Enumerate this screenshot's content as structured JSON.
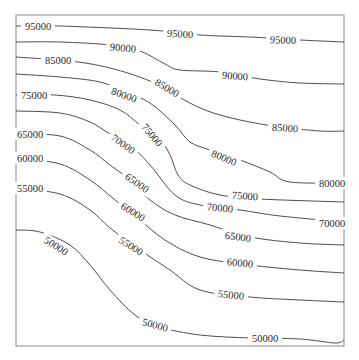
{
  "chart_data": {
    "type": "contour",
    "title": "",
    "xlabel": "",
    "ylabel": "",
    "grid": false,
    "legend": null,
    "levels": [
      50000,
      55000,
      60000,
      65000,
      70000,
      75000,
      80000,
      85000,
      90000,
      95000
    ],
    "frame": {
      "x0": 16,
      "y0": 15,
      "x1": 344,
      "y1": 346
    },
    "contours": [
      {
        "level": 95000,
        "points": [
          [
            16,
            26
          ],
          [
            60,
            26
          ],
          [
            150,
            30
          ],
          [
            200,
            35
          ],
          [
            250,
            37
          ],
          [
            300,
            40
          ],
          [
            344,
            42
          ]
        ],
        "labels": [
          {
            "text": "95000",
            "x": 38,
            "y": 26,
            "angle": 0
          },
          {
            "text": "95000",
            "x": 180,
            "y": 34,
            "angle": 3
          },
          {
            "text": "95000",
            "x": 283,
            "y": 40,
            "angle": 2
          }
        ]
      },
      {
        "level": 90000,
        "points": [
          [
            16,
            42
          ],
          [
            60,
            42
          ],
          [
            110,
            45
          ],
          [
            140,
            51
          ],
          [
            165,
            64
          ],
          [
            180,
            70
          ],
          [
            220,
            72
          ],
          [
            260,
            79
          ],
          [
            300,
            83
          ],
          [
            344,
            84
          ]
        ],
        "labels": [
          {
            "text": "90000",
            "x": 123,
            "y": 48,
            "angle": 5
          },
          {
            "text": "90000",
            "x": 235,
            "y": 76,
            "angle": 4
          }
        ]
      },
      {
        "level": 85000,
        "points": [
          [
            16,
            57
          ],
          [
            70,
            61
          ],
          [
            110,
            68
          ],
          [
            150,
            81
          ],
          [
            175,
            95
          ],
          [
            205,
            110
          ],
          [
            240,
            120
          ],
          [
            280,
            127
          ],
          [
            320,
            131
          ],
          [
            344,
            131
          ]
        ],
        "labels": [
          {
            "text": "85000",
            "x": 58,
            "y": 60,
            "angle": 0
          },
          {
            "text": "85000",
            "x": 167,
            "y": 88,
            "angle": 30
          },
          {
            "text": "85000",
            "x": 285,
            "y": 128,
            "angle": 3
          }
        ]
      },
      {
        "level": 80000,
        "points": [
          [
            16,
            74
          ],
          [
            60,
            77
          ],
          [
            100,
            82
          ],
          [
            125,
            92
          ],
          [
            150,
            103
          ],
          [
            175,
            125
          ],
          [
            190,
            142
          ],
          [
            210,
            150
          ],
          [
            240,
            160
          ],
          [
            270,
            172
          ],
          [
            290,
            182
          ],
          [
            344,
            183
          ]
        ],
        "labels": [
          {
            "text": "80000",
            "x": 124,
            "y": 95,
            "angle": 20
          },
          {
            "text": "80000",
            "x": 224,
            "y": 158,
            "angle": 22
          },
          {
            "text": "80000",
            "x": 332,
            "y": 183,
            "angle": 0
          }
        ]
      },
      {
        "level": 75000,
        "points": [
          [
            16,
            95
          ],
          [
            55,
            95
          ],
          [
            90,
            100
          ],
          [
            120,
            110
          ],
          [
            140,
            125
          ],
          [
            160,
            140
          ],
          [
            170,
            155
          ],
          [
            178,
            175
          ],
          [
            190,
            185
          ],
          [
            220,
            195
          ],
          [
            260,
            199
          ],
          [
            344,
            202
          ]
        ],
        "labels": [
          {
            "text": "75000",
            "x": 34,
            "y": 95,
            "angle": 0
          },
          {
            "text": "75000",
            "x": 152,
            "y": 135,
            "angle": 50
          },
          {
            "text": "75000",
            "x": 245,
            "y": 196,
            "angle": 4
          }
        ]
      },
      {
        "level": 70000,
        "points": [
          [
            16,
            111
          ],
          [
            60,
            113
          ],
          [
            90,
            122
          ],
          [
            110,
            134
          ],
          [
            130,
            145
          ],
          [
            150,
            165
          ],
          [
            175,
            195
          ],
          [
            200,
            205
          ],
          [
            240,
            210
          ],
          [
            280,
            216
          ],
          [
            344,
            222
          ]
        ],
        "labels": [
          {
            "text": "70000",
            "x": 123,
            "y": 144,
            "angle": 35
          },
          {
            "text": "70000",
            "x": 220,
            "y": 208,
            "angle": 5
          },
          {
            "text": "70000",
            "x": 332,
            "y": 223,
            "angle": 0
          }
        ]
      },
      {
        "level": 65000,
        "points": [
          [
            16,
            134
          ],
          [
            60,
            136
          ],
          [
            90,
            150
          ],
          [
            110,
            165
          ],
          [
            130,
            180
          ],
          [
            150,
            200
          ],
          [
            175,
            215
          ],
          [
            210,
            225
          ],
          [
            250,
            237
          ],
          [
            300,
            243
          ],
          [
            344,
            245
          ]
        ],
        "labels": [
          {
            "text": "65000",
            "x": 30,
            "y": 134,
            "angle": 0
          },
          {
            "text": "65000",
            "x": 137,
            "y": 183,
            "angle": 35
          },
          {
            "text": "65000",
            "x": 238,
            "y": 237,
            "angle": 8
          }
        ]
      },
      {
        "level": 60000,
        "points": [
          [
            16,
            158
          ],
          [
            60,
            164
          ],
          [
            90,
            180
          ],
          [
            115,
            200
          ],
          [
            140,
            220
          ],
          [
            165,
            240
          ],
          [
            200,
            257
          ],
          [
            250,
            265
          ],
          [
            300,
            270
          ],
          [
            344,
            273
          ]
        ],
        "labels": [
          {
            "text": "60000",
            "x": 30,
            "y": 158,
            "angle": 0
          },
          {
            "text": "60000",
            "x": 133,
            "y": 212,
            "angle": 32
          },
          {
            "text": "60000",
            "x": 240,
            "y": 263,
            "angle": 6
          }
        ]
      },
      {
        "level": 55000,
        "points": [
          [
            16,
            188
          ],
          [
            60,
            194
          ],
          [
            90,
            210
          ],
          [
            110,
            228
          ],
          [
            140,
            250
          ],
          [
            170,
            270
          ],
          [
            200,
            290
          ],
          [
            250,
            297
          ],
          [
            300,
            300
          ],
          [
            344,
            302
          ]
        ],
        "labels": [
          {
            "text": "55000",
            "x": 30,
            "y": 188,
            "angle": 0
          },
          {
            "text": "55000",
            "x": 131,
            "y": 246,
            "angle": 32
          },
          {
            "text": "55000",
            "x": 231,
            "y": 295,
            "angle": 6
          }
        ]
      },
      {
        "level": 50000,
        "points": [
          [
            16,
            230
          ],
          [
            40,
            232
          ],
          [
            70,
            245
          ],
          [
            90,
            265
          ],
          [
            110,
            290
          ],
          [
            135,
            315
          ],
          [
            160,
            327
          ],
          [
            200,
            335
          ],
          [
            250,
            338
          ],
          [
            300,
            339
          ],
          [
            335,
            343
          ],
          [
            344,
            340
          ]
        ],
        "labels": [
          {
            "text": "50000",
            "x": 56,
            "y": 246,
            "angle": 33
          },
          {
            "text": "50000",
            "x": 155,
            "y": 325,
            "angle": 15
          },
          {
            "text": "50000",
            "x": 265,
            "y": 338,
            "angle": 0
          }
        ]
      }
    ]
  }
}
